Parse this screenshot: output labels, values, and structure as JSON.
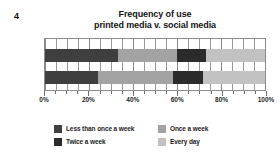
{
  "question_number": "4",
  "chart_data": {
    "type": "bar",
    "orientation": "horizontal",
    "stacked": true,
    "stack_total": 100,
    "title": "Frequency of use",
    "subtitle": "printed media v. social media",
    "title_lines": [
      "Frequency of use",
      "printed media v. social media"
    ],
    "xlabel": "",
    "ylabel": "",
    "xlim": [
      0,
      100
    ],
    "xticks": [
      0,
      20,
      40,
      60,
      80,
      100
    ],
    "xtick_labels": [
      "0%",
      "20%",
      "40%",
      "60%",
      "80%",
      "100%"
    ],
    "minor_tick_interval": 5,
    "grid": true,
    "legend_position": "bottom",
    "categories": [
      "printed media",
      "social media"
    ],
    "series": [
      {
        "name": "Less than once a week",
        "color": "#3f3f3f",
        "values": [
          33,
          24
        ]
      },
      {
        "name": "Once a week",
        "color": "#a3a3a3",
        "values": [
          27,
          34
        ]
      },
      {
        "name": "Twice a week",
        "color": "#2b2b2b",
        "values": [
          13,
          14
        ]
      },
      {
        "name": "Every day",
        "color": "#c2c2c2",
        "values": [
          27,
          28
        ]
      }
    ],
    "bars": [
      {
        "name": "printed media",
        "segments": [
          {
            "label": "Less than once a week",
            "value": 33,
            "color": "#3f3f3f"
          },
          {
            "label": "Once a week",
            "value": 27,
            "color": "#a3a3a3"
          },
          {
            "label": "Twice a week",
            "value": 13,
            "color": "#2b2b2b"
          },
          {
            "label": "Every day",
            "value": 27,
            "color": "#c2c2c2"
          }
        ]
      },
      {
        "name": "social media",
        "segments": [
          {
            "label": "Less than once a week",
            "value": 24,
            "color": "#3f3f3f"
          },
          {
            "label": "Once a week",
            "value": 34,
            "color": "#a3a3a3"
          },
          {
            "label": "Twice a week",
            "value": 14,
            "color": "#2b2b2b"
          },
          {
            "label": "Every day",
            "value": 28,
            "color": "#c2c2c2"
          }
        ]
      }
    ],
    "legend": [
      {
        "label": "Less than once a week",
        "color": "#3f3f3f"
      },
      {
        "label": "Once a week",
        "color": "#a3a3a3"
      },
      {
        "label": "Twice a week",
        "color": "#2b2b2b"
      },
      {
        "label": "Every day",
        "color": "#c2c2c2"
      }
    ]
  },
  "colors": {
    "frame": "#8d8d8d",
    "grid": "#9a9a9a",
    "text": "#1b1b1b",
    "background": "#ffffff"
  }
}
